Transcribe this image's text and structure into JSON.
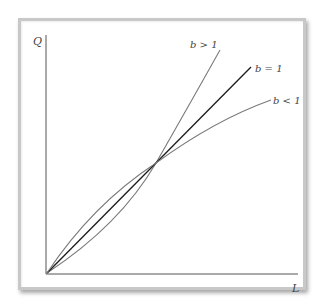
{
  "diagram": {
    "axes": {
      "y_label": "Q",
      "x_label": "L"
    },
    "curves": [
      {
        "id": "b-greater-1",
        "label": "b > 1",
        "color": "#7a7a7a",
        "shape": "convex"
      },
      {
        "id": "b-equal-1",
        "label": "b = 1",
        "color": "#1a1a1a",
        "shape": "linear"
      },
      {
        "id": "b-less-1",
        "label": "b < 1",
        "color": "#7a7a7a",
        "shape": "concave"
      }
    ],
    "intersection_note": "All three curves intersect at the origin and at a common point"
  },
  "colors": {
    "frame_border": "#c8c8c8",
    "axis": "#555555",
    "background": "#ffffff"
  }
}
